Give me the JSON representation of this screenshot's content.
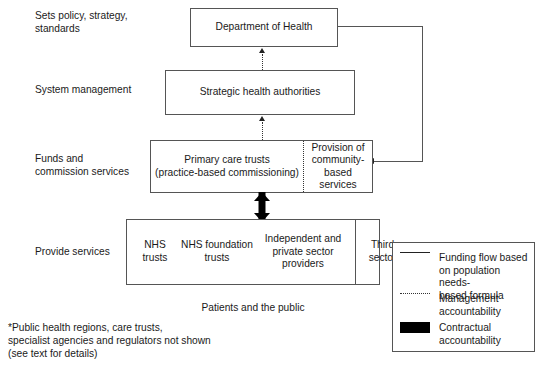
{
  "diagram": {
    "row_labels": [
      {
        "id": "sets-policy",
        "text": "Sets policy, strategy,\nstandards"
      },
      {
        "id": "system-management",
        "text": "System management"
      },
      {
        "id": "funds-commission",
        "text": "Funds and\ncommission services"
      },
      {
        "id": "provide-services",
        "text": "Provide services"
      }
    ],
    "boxes": {
      "department_of_health": "Department of Health",
      "strategic_health_authorities": "Strategic health authorities",
      "primary_care_trusts": "Primary care trusts\n(practice-based commissioning)",
      "provision_community": "Provision of\ncommunity-\nbased\nservices",
      "nhs_trusts": "NHS\ntrusts",
      "nhs_foundation_trusts": "NHS foundation\ntrusts",
      "independent_private": "Independent and\nprivate sector\nproviders",
      "third_sector": "Third\nsector"
    },
    "captions": {
      "patients_public": "Patients and the public",
      "footnote": "*Public health regions, care trusts,\nspecialist agencies and regulators not shown\n(see text for details)"
    },
    "legend": {
      "items": [
        {
          "key": "solid-line",
          "label": "Funding flow based\non population needs-\nbased formula"
        },
        {
          "key": "dotted-line",
          "label": "Management\naccountability"
        },
        {
          "key": "black-block",
          "label": "Contractual\naccountability"
        }
      ]
    },
    "colors": {
      "background": "#ffffff",
      "box_border": "#555555",
      "text": "#1a1a1a",
      "contractual": "#000000"
    }
  }
}
